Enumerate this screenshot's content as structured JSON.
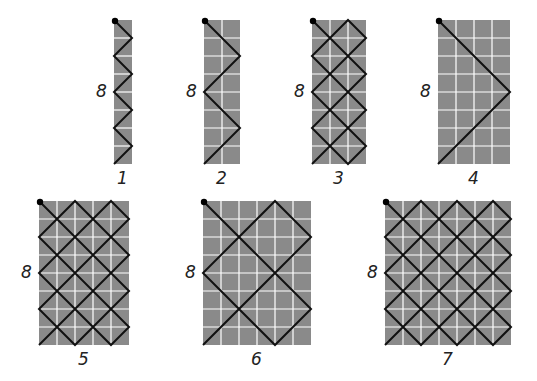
{
  "grid_style": {
    "fill": "#8a8a8a",
    "grid_line": "#ffffff",
    "path": "#111111",
    "start_dot": "#000000",
    "cell_px": 18
  },
  "figures": [
    {
      "id": 1,
      "label": "1",
      "height_label": "8",
      "cols": 1,
      "rows": 8,
      "x": 114,
      "y": 20
    },
    {
      "id": 2,
      "label": "2",
      "height_label": "8",
      "cols": 2,
      "rows": 8,
      "x": 204,
      "y": 20
    },
    {
      "id": 3,
      "label": "3",
      "height_label": "8",
      "cols": 3,
      "rows": 8,
      "x": 312,
      "y": 20
    },
    {
      "id": 4,
      "label": "4",
      "height_label": "8",
      "cols": 4,
      "rows": 8,
      "x": 438,
      "y": 20
    },
    {
      "id": 5,
      "label": "5",
      "height_label": "8",
      "cols": 5,
      "rows": 8,
      "x": 39,
      "y": 201
    },
    {
      "id": 6,
      "label": "6",
      "height_label": "8",
      "cols": 6,
      "rows": 8,
      "x": 203,
      "y": 201
    },
    {
      "id": 7,
      "label": "7",
      "height_label": "8",
      "cols": 7,
      "rows": 8,
      "x": 385,
      "y": 201
    }
  ]
}
